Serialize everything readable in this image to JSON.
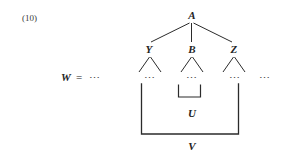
{
  "figure": {
    "equation_number": "(10)",
    "background_color": "#ffffff",
    "ink_color": "#2b2b2b",
    "left_expression": {
      "variable": "W",
      "equals": "=",
      "ellipsis": "⋯"
    },
    "right_ellipsis": "⋯",
    "tree": {
      "root": {
        "label": "A"
      },
      "children": [
        {
          "label": "Y",
          "leaf_ellipsis": "⋯"
        },
        {
          "label": "B",
          "leaf_ellipsis": "⋯"
        },
        {
          "label": "Z",
          "leaf_ellipsis": "⋯"
        }
      ]
    },
    "brackets": [
      {
        "label": "U",
        "spans": "B-subtree"
      },
      {
        "label": "V",
        "spans": "Y-through-Z"
      }
    ]
  }
}
